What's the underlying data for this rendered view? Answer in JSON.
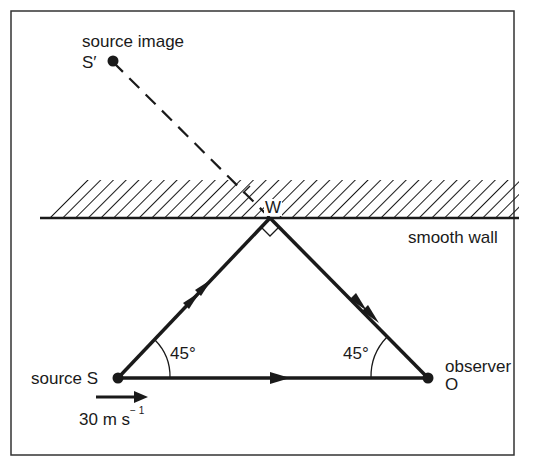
{
  "figure": {
    "labels": {
      "source_image": "source image",
      "source_image_point": "S′",
      "wall_point": "W",
      "wall": "smooth wall",
      "angle_left": "45°",
      "angle_right": "45°",
      "source": "source S",
      "observer": "observer",
      "observer_point": "O",
      "speed_value": "30 m s",
      "speed_exponent": "− 1"
    },
    "points": {
      "S": {
        "x": 118,
        "y": 378
      },
      "O": {
        "x": 428,
        "y": 378
      },
      "W": {
        "x": 270,
        "y": 218
      },
      "S_prime": {
        "x": 113,
        "y": 60
      }
    },
    "angles_deg": {
      "at_S": 45,
      "at_O": 45,
      "at_W": 90
    },
    "source_velocity": "30 m s⁻¹",
    "colors": {
      "ink": "#1a1a1a",
      "background": "#ffffff"
    }
  }
}
